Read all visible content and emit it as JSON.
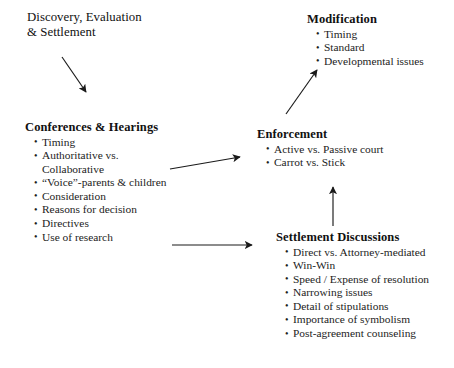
{
  "diagram": {
    "background_color": "#ffffff",
    "text_color": "#1a1a1a",
    "arrow_color": "#1a1a1a",
    "nodes": {
      "discovery": {
        "title": "Discovery, Evaluation\n& Settlement",
        "bullets": []
      },
      "conferences": {
        "title": "Conferences & Hearings",
        "bullets": [
          "Timing",
          "Authoritative vs.\n   Collaborative",
          "“Voice”-parents & children",
          "Consideration",
          "Reasons for decision",
          "Directives",
          "Use of research"
        ]
      },
      "modification": {
        "title": "Modification",
        "bullets": [
          "Timing",
          "Standard",
          "Developmental issues"
        ]
      },
      "enforcement": {
        "title": "Enforcement",
        "bullets": [
          "Active vs. Passive court",
          "Carrot vs. Stick"
        ]
      },
      "settlement": {
        "title": "Settlement Discussions",
        "bullets": [
          "Direct vs. Attorney-mediated",
          "Win-Win",
          "Speed / Expense of resolution",
          "Narrowing issues",
          "Detail of stipulations",
          "Importance of symbolism",
          "Post-agreement counseling"
        ]
      }
    },
    "arrows": [
      {
        "name": "discovery-to-conferences",
        "from": "discovery",
        "to": "conferences",
        "direction": "down-right"
      },
      {
        "name": "conferences-to-enforcement",
        "from": "conferences",
        "to": "enforcement",
        "direction": "right-up"
      },
      {
        "name": "conferences-to-settlement",
        "from": "conferences",
        "to": "settlement",
        "direction": "right"
      },
      {
        "name": "settlement-to-enforcement",
        "from": "settlement",
        "to": "enforcement",
        "direction": "up"
      },
      {
        "name": "enforcement-to-modification",
        "from": "enforcement",
        "to": "modification",
        "direction": "up-right"
      }
    ]
  }
}
